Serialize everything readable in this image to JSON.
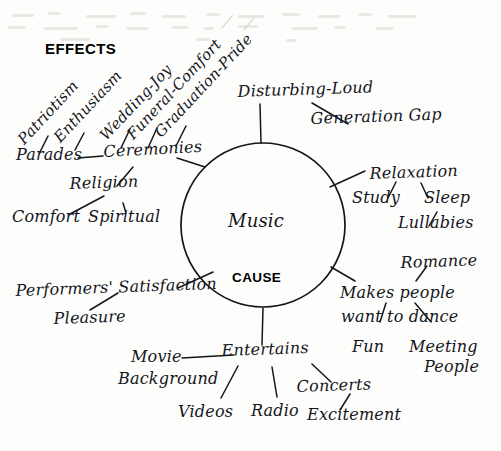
{
  "diagram": {
    "type": "cause-effect-mind-map",
    "medium": "handwritten-cursive-scan",
    "ink_color": "#14161c",
    "paper_color": "#fdfdfb",
    "center": {
      "topic_label": "Music",
      "cause_label": "CAUSE",
      "shape": "circle",
      "cx": 263,
      "cy": 225,
      "r": 82
    },
    "section_headers": [
      {
        "name": "effects-header",
        "text": "EFFECTS",
        "x": 45,
        "y": 42
      }
    ],
    "branches": [
      {
        "id": "ceremonies",
        "label": "Ceremonies",
        "children": [
          {
            "label": "Patriotism"
          },
          {
            "label": "Enthusiasm"
          },
          {
            "label": "Wedding-Joy"
          },
          {
            "label": "Funeral-Comfort"
          },
          {
            "label": "Graduation-Pride"
          },
          {
            "label": "Parades"
          },
          {
            "label": "Religion",
            "children": [
              {
                "label": "Comfort"
              },
              {
                "label": "Spiritual"
              }
            ]
          }
        ]
      },
      {
        "id": "disturbing-loud",
        "label": "Disturbing-Loud",
        "children": [
          {
            "label": "Generation Gap"
          }
        ]
      },
      {
        "id": "relaxation",
        "label": "Relaxation",
        "children": [
          {
            "label": "Study"
          },
          {
            "label": "Sleep",
            "children": [
              {
                "label": "Lullabies"
              }
            ]
          }
        ]
      },
      {
        "id": "makes-people-want-to-dance",
        "label": "Makes people want to dance",
        "children": [
          {
            "label": "Romance"
          },
          {
            "label": "Fun"
          },
          {
            "label": "Meeting People"
          }
        ]
      },
      {
        "id": "performers-satisfaction",
        "label": "Performers' Satisfaction",
        "children": [
          {
            "label": "Pleasure"
          }
        ]
      },
      {
        "id": "entertains",
        "label": "Entertains",
        "children": [
          {
            "label": "Movie Background"
          },
          {
            "label": "Videos"
          },
          {
            "label": "Radio"
          },
          {
            "label": "Concerts",
            "children": [
              {
                "label": "Excitement"
              }
            ]
          }
        ]
      }
    ]
  },
  "labels": {
    "effects": "EFFECTS",
    "cause": "CAUSE",
    "music": "Music",
    "patriotism": "Patriotism",
    "enthusiasm": "Enthusiasm",
    "wedding_joy": "Wedding-Joy",
    "funeral_comfort": "Funeral-Comfort",
    "graduation_pride": "Graduation-Pride",
    "parades": "Parades",
    "ceremonies": "Ceremonies",
    "religion": "Religion",
    "comfort": "Comfort",
    "spiritual": "Spiritual",
    "disturbing_loud": "Disturbing-Loud",
    "generation_gap": "Generation Gap",
    "relaxation": "Relaxation",
    "study": "Study",
    "sleep": "Sleep",
    "lullabies": "Lullabies",
    "romance": "Romance",
    "makes_people": "Makes people",
    "want_to_dance": "want to dance",
    "fun": "Fun",
    "meeting": "Meeting",
    "people": "People",
    "performers_satisfaction": "Performers' Satisfaction",
    "pleasure": "Pleasure",
    "movie": "Movie",
    "background": "Background",
    "entertains": "Entertains",
    "videos": "Videos",
    "radio": "Radio",
    "concerts": "Concerts",
    "excitement": "Excitement"
  }
}
